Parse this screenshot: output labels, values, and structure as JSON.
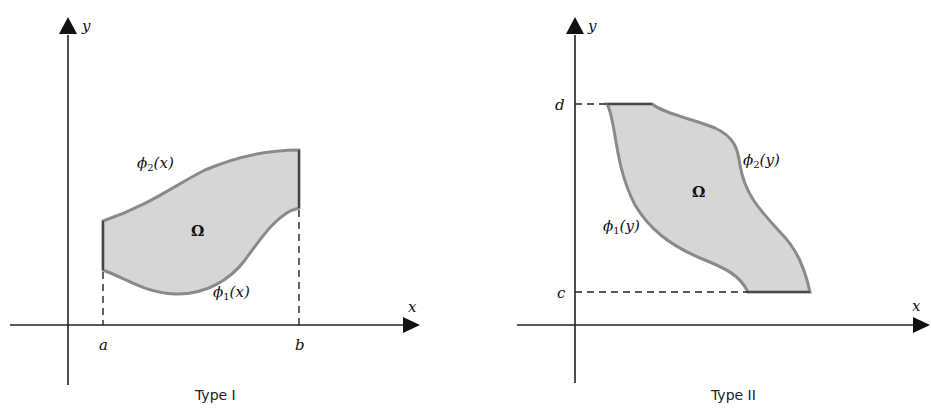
{
  "diagrams": [
    {
      "caption": "Type I",
      "axis_x_label": "x",
      "axis_y_label": "y",
      "region_label": "Ω",
      "upper_curve_label": {
        "base": "ϕ",
        "sub": "2",
        "arg": "(x)"
      },
      "lower_curve_label": {
        "base": "ϕ",
        "sub": "1",
        "arg": "(x)"
      },
      "bound_left": "a",
      "bound_right": "b",
      "region_fill": "#d6d6d6",
      "boundary_color": "#8a8a8a"
    },
    {
      "caption": "Type II",
      "axis_x_label": "x",
      "axis_y_label": "y",
      "region_label": "Ω",
      "right_curve_label": {
        "base": "ϕ",
        "sub": "2",
        "arg": "(y)"
      },
      "left_curve_label": {
        "base": "ϕ",
        "sub": "1",
        "arg": "(y)"
      },
      "bound_top": "d",
      "bound_bottom": "c",
      "region_fill": "#d6d6d6",
      "boundary_color": "#8a8a8a"
    }
  ]
}
